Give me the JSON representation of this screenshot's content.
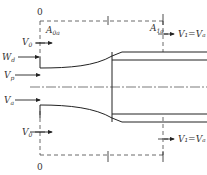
{
  "diagram": {
    "title": "",
    "sections": {
      "inlet": "0",
      "mid": "1",
      "outlet": "1"
    },
    "labels": {
      "a_inlet_main": "A",
      "a_inlet_sub": "0a",
      "a_outlet_main": "A",
      "a_outlet_sub": "1a",
      "w_main": "W",
      "w_sub": "d",
      "v0_top_main": "V",
      "v0_top_sub": "0",
      "vp_main": "V",
      "vp_sub": "p",
      "va_main": "V",
      "va_sub": "a",
      "v0_bottom_main": "V",
      "v0_bottom_sub": "0",
      "out_top": "V₁=Vₐ",
      "out_bottom": "V₁=Vₐ"
    },
    "colors": {
      "stroke": "#222222",
      "dashed": "#444444",
      "background": "#ffffff"
    }
  }
}
